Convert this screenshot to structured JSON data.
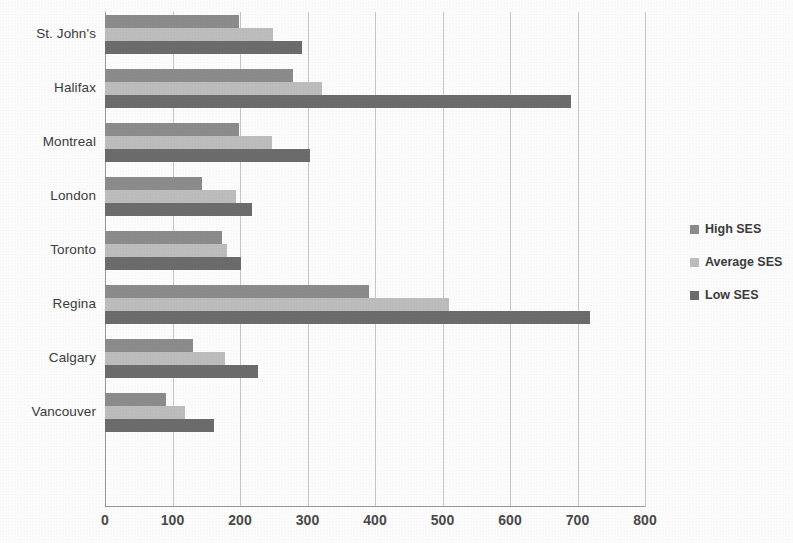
{
  "chart_data": {
    "type": "bar",
    "orientation": "horizontal",
    "title": "",
    "xlabel": "",
    "ylabel": "",
    "xlim": [
      0,
      800
    ],
    "xticks": [
      0,
      100,
      200,
      300,
      400,
      500,
      600,
      700,
      800
    ],
    "grid": "vertical",
    "legend_position": "right",
    "categories": [
      "St. John's",
      "Halifax",
      "Montreal",
      "London",
      "Toronto",
      "Regina",
      "Calgary",
      "Vancouver"
    ],
    "series": [
      {
        "name": "High SES",
        "color": "#8d8d8d",
        "values": [
          198,
          278,
          198,
          143,
          174,
          391,
          130,
          90
        ]
      },
      {
        "name": "Average SES",
        "color": "#bfbfbf",
        "values": [
          249,
          321,
          247,
          194,
          180,
          510,
          178,
          119
        ]
      },
      {
        "name": "Low SES",
        "color": "#6d6d6d",
        "values": [
          292,
          690,
          303,
          218,
          201,
          719,
          227,
          161
        ]
      }
    ]
  }
}
